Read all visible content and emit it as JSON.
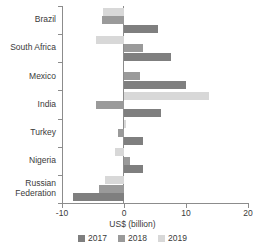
{
  "chart_data": {
    "type": "bar",
    "orientation": "horizontal",
    "title": "",
    "subtitle": "",
    "xlabel": "US$ (billion)",
    "ylabel": "",
    "xlim": [
      -10,
      20
    ],
    "xticks": [
      -10,
      0,
      10,
      20
    ],
    "xtick_labels": [
      "-10",
      "0",
      "10",
      "20"
    ],
    "grid": false,
    "legend_position": "bottom",
    "categories": [
      "Brazil",
      "South Africa",
      "Mexico",
      "India",
      "Turkey",
      "Nigeria",
      "Russian Federation"
    ],
    "series": [
      {
        "name": "2017",
        "color": "#7f7f7f",
        "values": [
          5.5,
          7.5,
          10.0,
          6.0,
          3.0,
          3.0,
          -8.2
        ]
      },
      {
        "name": "2018",
        "color": "#9a9a9a",
        "values": [
          -3.5,
          3.0,
          2.5,
          -4.5,
          -1.0,
          1.0,
          -4.0
        ]
      },
      {
        "name": "2019",
        "color": "#d8d8d8",
        "values": [
          -3.4,
          -4.5,
          0.0,
          13.7,
          0.3,
          -1.5,
          -3.0
        ]
      }
    ]
  },
  "axis": {
    "x_title": "US$ (billion)",
    "tick_labels": [
      "-10",
      "0",
      "10",
      "20"
    ]
  },
  "legend": {
    "items": [
      {
        "label": "2017",
        "color": "#7f7f7f"
      },
      {
        "label": "2018",
        "color": "#9a9a9a"
      },
      {
        "label": "2019",
        "color": "#d8d8d8"
      }
    ]
  },
  "categories": [
    {
      "label": "Brazil"
    },
    {
      "label": "South Africa"
    },
    {
      "label": "Mexico"
    },
    {
      "label": "India"
    },
    {
      "label": "Turkey"
    },
    {
      "label": "Nigeria"
    },
    {
      "label": "Russian Federation"
    }
  ]
}
